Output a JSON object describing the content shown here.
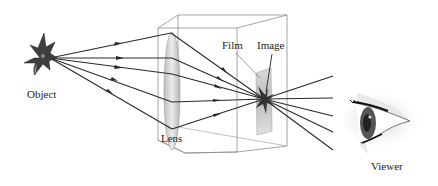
{
  "diagram": {
    "labels": {
      "object": "Object",
      "lens": "Lens",
      "film": "Film",
      "image": "Image",
      "viewer": "Viewer"
    },
    "components": [
      "object-flower",
      "camera-box",
      "lens",
      "film",
      "image",
      "viewer-eye"
    ],
    "ray_count_incoming": 5,
    "ray_count_outgoing": 5,
    "colors": {
      "ray": "#2a2a2a",
      "box_edge": "#8a8a8a",
      "flower": "#3a3a3a",
      "lens_fill": "#d8d8d8",
      "film_fill": "#cfcfcf"
    }
  }
}
